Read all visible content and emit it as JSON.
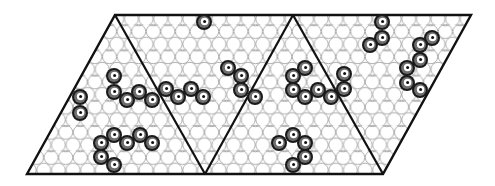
{
  "figure": {
    "colors": {
      "background": "#ffffff",
      "outline": "#111111",
      "grid_circle": "#9a9a9a",
      "atom_outer": "#1a1a1a",
      "atom_ring": "#6e6e6e",
      "atom_center": "#ffffff",
      "atom_dot": "#111111"
    },
    "parallelogram": {
      "points": [
        [
          27,
          174
        ],
        [
          115,
          15
        ],
        [
          471,
          15
        ],
        [
          383,
          174
        ]
      ]
    },
    "dividers": [
      [
        [
          115,
          15
        ],
        [
          205,
          174
        ]
      ],
      [
        [
          205,
          174
        ],
        [
          293,
          15
        ]
      ],
      [
        [
          293,
          15
        ],
        [
          383,
          174
        ]
      ]
    ],
    "atom_radius": 8,
    "atoms": [
      {
        "x": 80,
        "y": 97
      },
      {
        "x": 80,
        "y": 113
      },
      {
        "x": 114,
        "y": 76
      },
      {
        "x": 114,
        "y": 92
      },
      {
        "x": 127,
        "y": 100
      },
      {
        "x": 139,
        "y": 92
      },
      {
        "x": 152,
        "y": 100
      },
      {
        "x": 166,
        "y": 89
      },
      {
        "x": 178,
        "y": 97
      },
      {
        "x": 191,
        "y": 89
      },
      {
        "x": 203,
        "y": 97
      },
      {
        "x": 204,
        "y": 22
      },
      {
        "x": 228,
        "y": 68
      },
      {
        "x": 241,
        "y": 76
      },
      {
        "x": 241,
        "y": 90
      },
      {
        "x": 255,
        "y": 97
      },
      {
        "x": 101,
        "y": 143
      },
      {
        "x": 114,
        "y": 135
      },
      {
        "x": 127,
        "y": 143
      },
      {
        "x": 140,
        "y": 135
      },
      {
        "x": 152,
        "y": 143
      },
      {
        "x": 101,
        "y": 157
      },
      {
        "x": 114,
        "y": 165
      },
      {
        "x": 305,
        "y": 68
      },
      {
        "x": 293,
        "y": 76
      },
      {
        "x": 293,
        "y": 90
      },
      {
        "x": 305,
        "y": 97
      },
      {
        "x": 318,
        "y": 90
      },
      {
        "x": 331,
        "y": 97
      },
      {
        "x": 344,
        "y": 74
      },
      {
        "x": 344,
        "y": 89
      },
      {
        "x": 279,
        "y": 143
      },
      {
        "x": 293,
        "y": 135
      },
      {
        "x": 305,
        "y": 143
      },
      {
        "x": 305,
        "y": 157
      },
      {
        "x": 293,
        "y": 165
      },
      {
        "x": 382,
        "y": 22
      },
      {
        "x": 382,
        "y": 38
      },
      {
        "x": 370,
        "y": 45
      },
      {
        "x": 432,
        "y": 38
      },
      {
        "x": 420,
        "y": 45
      },
      {
        "x": 420,
        "y": 60
      },
      {
        "x": 407,
        "y": 68
      },
      {
        "x": 407,
        "y": 83
      },
      {
        "x": 420,
        "y": 90
      }
    ]
  }
}
